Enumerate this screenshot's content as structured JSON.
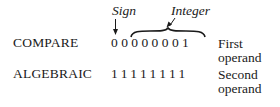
{
  "annotations": {
    "sign_label": "Sign",
    "integer_label": "Integer"
  },
  "rows": [
    {
      "instruction": "COMPARE",
      "bits": "00000001",
      "operand_label_line1": "First",
      "operand_label_line2": "operand"
    },
    {
      "instruction": "ALGEBRAIC",
      "bits": "11111111",
      "operand_label_line1": "Second",
      "operand_label_line2": "operand"
    }
  ],
  "colors": {
    "ink": "#1a1a1a",
    "background": "#ffffff"
  }
}
